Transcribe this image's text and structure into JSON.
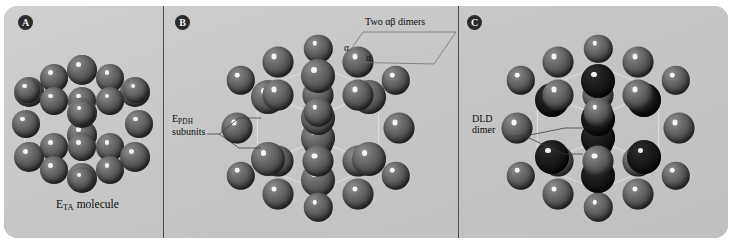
{
  "figure": {
    "width": 732,
    "height": 245,
    "background_color": "#ffffff",
    "panel_color": "#c9c9c9",
    "divider_color": "#4c4c4c",
    "wireframe_color": "#dcdcdc",
    "label_badge_color": "#2b2b2b",
    "label_text_color": "#f2f2f2"
  },
  "panels": [
    {
      "id": "A",
      "label": "A",
      "caption_prefix": "E",
      "caption_subscript": "TA",
      "caption_suffix": " molecule",
      "caption_full": "ETA molecule",
      "model": {
        "type": "space-filling-cube",
        "sphere_shade": "mid",
        "outer_shell": false
      }
    },
    {
      "id": "B",
      "label": "B",
      "annotations": [
        {
          "name": "two-ab-dimers",
          "text": "Two αβ dimers"
        },
        {
          "name": "epdh-subunits",
          "line1_prefix": "E",
          "line1_subscript": "PDH",
          "line2": "subunits",
          "text_full": "EPDH subunits"
        }
      ],
      "greek_markers": [
        "α",
        "α"
      ],
      "model": {
        "type": "space-filling-cube",
        "sphere_shade": "mid",
        "outer_shell": true
      }
    },
    {
      "id": "C",
      "label": "C",
      "annotations": [
        {
          "name": "dld-dimer",
          "line1": "DLD",
          "line2": "dimer",
          "text_full": "DLD dimer"
        }
      ],
      "model": {
        "type": "space-filling-cube",
        "sphere_shade": "mid",
        "core_shade": "verydark",
        "outer_shell": true
      }
    }
  ]
}
